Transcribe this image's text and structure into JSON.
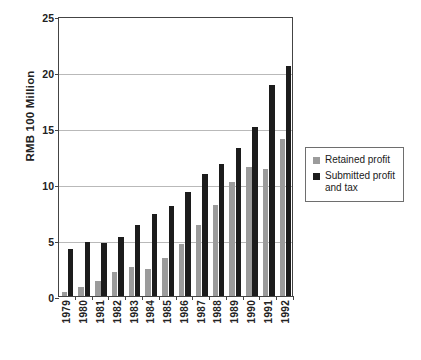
{
  "chart_data": {
    "type": "bar",
    "title": "",
    "xlabel": "",
    "ylabel": "RMB 100 Million",
    "ylim": [
      0,
      25
    ],
    "yticks": [
      0,
      5,
      10,
      15,
      20,
      25
    ],
    "ytick_labels": [
      "0",
      "5",
      "10",
      "15",
      "20",
      "25"
    ],
    "grid": true,
    "legend_position": "right",
    "categories": [
      "1979",
      "1980",
      "1981",
      "1982",
      "1983",
      "1984",
      "1985",
      "1986",
      "1987",
      "1988",
      "1989",
      "1990",
      "1991",
      "1992"
    ],
    "series": [
      {
        "name": "Retained profit",
        "color": "#9b9b9b",
        "values": [
          0.4,
          0.8,
          1.3,
          2.1,
          2.6,
          2.4,
          3.4,
          4.6,
          6.3,
          8.1,
          10.2,
          11.5,
          11.3,
          14.0
        ]
      },
      {
        "name": "Submitted profit and tax",
        "color": "#1c1c1c",
        "values": [
          4.2,
          4.8,
          4.7,
          5.3,
          6.3,
          7.3,
          8.0,
          9.3,
          10.9,
          11.8,
          13.2,
          15.1,
          18.8,
          20.5
        ]
      }
    ]
  },
  "legend": {
    "items": [
      {
        "label": "Retained profit",
        "swatch": "retained"
      },
      {
        "label": "Submitted profit and tax",
        "swatch": "submitted"
      }
    ]
  }
}
